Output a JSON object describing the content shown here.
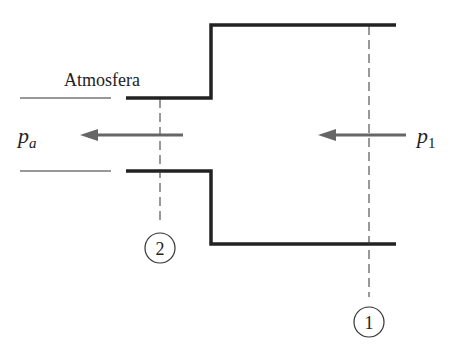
{
  "diagram": {
    "labels": {
      "atmosphere": "Atmosfera",
      "pa_main": "p",
      "pa_sub": "a",
      "p1_main": "p",
      "p1_sub": "1"
    },
    "sections": [
      {
        "id": "1",
        "label": "1"
      },
      {
        "id": "2",
        "label": "2"
      }
    ],
    "colors": {
      "wall": "#222222",
      "arrow": "#666666",
      "dashed": "#333333",
      "text": "#222222"
    }
  }
}
